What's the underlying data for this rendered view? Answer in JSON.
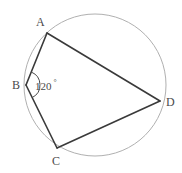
{
  "figure": {
    "kind": "circle-geometry-diagram",
    "background_color": "#ffffff",
    "circle": {
      "name": "circumscribed-circle",
      "center_x": 95,
      "center_y": 85,
      "radius": 71,
      "stroke_color": "#b0b0b0",
      "stroke_width": 1
    },
    "chord_color": "#3a3a3a",
    "chord_width": 1.6,
    "points": [
      {
        "id": "A",
        "label": "A",
        "x": 47,
        "y": 33,
        "label_x": 36,
        "label_y": 16
      },
      {
        "id": "B",
        "label": "B",
        "x": 26,
        "y": 85,
        "label_x": 12,
        "label_y": 79
      },
      {
        "id": "C",
        "label": "C",
        "x": 57,
        "y": 148,
        "label_x": 52,
        "label_y": 155
      },
      {
        "id": "D",
        "label": "D",
        "x": 160,
        "y": 101,
        "label_x": 166,
        "label_y": 96
      }
    ],
    "chords": [
      {
        "id": "AB",
        "from": "A",
        "to": "B"
      },
      {
        "id": "AD",
        "from": "A",
        "to": "D"
      },
      {
        "id": "BC",
        "from": "B",
        "to": "C"
      },
      {
        "id": "CD",
        "from": "C",
        "to": "D"
      }
    ],
    "angle_marks": [
      {
        "id": "angle-B",
        "at_vertex": "B",
        "value": "120",
        "degree_symbol": "°",
        "full_text": "120 °",
        "label_x": 35,
        "label_y": 79,
        "arc_color": "#4a4a4a"
      }
    ]
  }
}
